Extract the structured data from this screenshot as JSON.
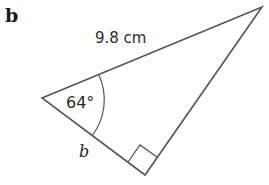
{
  "part_label": "b",
  "triangle": {
    "vertices": {
      "left": [
        42,
        98
      ],
      "top": [
        262,
        7
      ],
      "right_angle": [
        145,
        175
      ]
    },
    "stroke_color": "#555555"
  },
  "labels": {
    "hypotenuse": "9.8 cm",
    "angle": "64°",
    "side": "b"
  }
}
